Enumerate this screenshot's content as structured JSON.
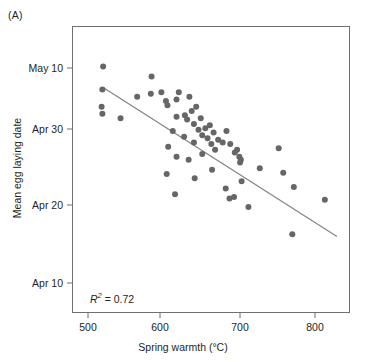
{
  "figure": {
    "panel_label": "(A)",
    "width": 366,
    "height": 362,
    "annotation_r2_prefix": "R",
    "annotation_r2_exponent": "2",
    "annotation_r2_value": " = 0.72",
    "annotation_r2_full": "R2 = 0.72"
  },
  "chart_data": {
    "type": "scatter",
    "title": "(A)",
    "xlabel": "Spring warmth (°C)",
    "ylabel": "Mean egg laying date",
    "xlim": [
      480,
      835
    ],
    "ylim_labels": [
      "Apr 10",
      "Apr 20",
      "Apr 30",
      "May 10"
    ],
    "xticks": [
      500,
      600,
      700,
      800
    ],
    "xtick_labels": [
      "500",
      "600",
      "700",
      "800"
    ],
    "yticks": [
      10,
      20,
      30,
      40
    ],
    "ytick_labels": [
      "Apr 10",
      "Apr 20",
      "Apr 30",
      "May 10"
    ],
    "ylim": [
      3.5,
      43.5
    ],
    "grid": false,
    "legend": null,
    "point_color": "#666666",
    "point_size_px": 6,
    "line_color": "#808080",
    "frame_color": "#6f6f6f",
    "annotations": [
      {
        "text": "R2 = 0.72",
        "x": 520,
        "y": 7.0
      }
    ],
    "trendline": {
      "label": "linear fit",
      "x_start": 521,
      "y_start": 37.2,
      "x_end": 829,
      "y_end": 16.5,
      "r_squared": 0.72
    },
    "series": [
      {
        "name": "Mean egg laying date vs spring warmth",
        "points": [
          [
            520,
            40.2
          ],
          [
            519,
            37.0
          ],
          [
            518,
            34.6
          ],
          [
            519,
            33.6
          ],
          [
            543,
            33.0
          ],
          [
            584,
            38.8
          ],
          [
            565,
            36.0
          ],
          [
            583,
            36.4
          ],
          [
            597,
            36.6
          ],
          [
            603,
            35.4
          ],
          [
            605,
            34.8
          ],
          [
            617,
            35.6
          ],
          [
            617,
            33.2
          ],
          [
            620,
            36.6
          ],
          [
            628,
            33.4
          ],
          [
            631,
            32.8
          ],
          [
            634,
            36.0
          ],
          [
            637,
            34.0
          ],
          [
            640,
            32.2
          ],
          [
            643,
            34.6
          ],
          [
            646,
            31.4
          ],
          [
            649,
            33.0
          ],
          [
            651,
            30.6
          ],
          [
            640,
            29.6
          ],
          [
            655,
            31.6
          ],
          [
            658,
            30.2
          ],
          [
            661,
            32.0
          ],
          [
            663,
            29.4
          ],
          [
            666,
            31.0
          ],
          [
            668,
            28.6
          ],
          [
            627,
            30.4
          ],
          [
            612,
            31.2
          ],
          [
            606,
            29.0
          ],
          [
            617,
            27.6
          ],
          [
            633,
            27.2
          ],
          [
            651,
            28.0
          ],
          [
            672,
            30.0
          ],
          [
            678,
            29.6
          ],
          [
            683,
            31.2
          ],
          [
            688,
            29.4
          ],
          [
            694,
            28.2
          ],
          [
            697,
            28.6
          ],
          [
            700,
            27.6
          ],
          [
            702,
            27.2
          ],
          [
            701,
            26.8
          ],
          [
            664,
            25.8
          ],
          [
            641,
            24.6
          ],
          [
            682,
            23.2
          ],
          [
            703,
            24.2
          ],
          [
            687,
            21.8
          ],
          [
            693,
            22.0
          ],
          [
            712,
            20.6
          ],
          [
            727,
            26.0
          ],
          [
            752,
            28.8
          ],
          [
            758,
            25.4
          ],
          [
            772,
            23.4
          ],
          [
            770,
            16.8
          ],
          [
            813,
            21.6
          ],
          [
            615,
            22.4
          ],
          [
            604,
            25.2
          ]
        ]
      }
    ]
  },
  "axes": {
    "y_ticks": [
      {
        "label": "May 10",
        "y_px": 68
      },
      {
        "label": "Apr 30",
        "y_px": 129
      },
      {
        "label": "Apr 20",
        "y_px": 205
      },
      {
        "label": "Apr 10",
        "y_px": 283
      }
    ],
    "x_ticks": [
      {
        "label": "500",
        "x_px": 88
      },
      {
        "label": "600",
        "x_px": 160
      },
      {
        "label": "700",
        "x_px": 240
      },
      {
        "label": "800",
        "x_px": 315
      }
    ],
    "x_title": "Spring warmth (°C)",
    "y_title": "Mean egg laying date"
  },
  "colors": {
    "point": "#666666",
    "line": "#808080",
    "frame": "#6f6f6f",
    "text": "#231f20",
    "background": "#ffffff"
  }
}
